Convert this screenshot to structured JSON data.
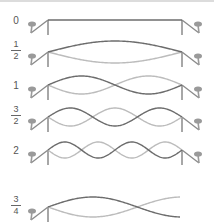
{
  "diagram": {
    "colors": {
      "dark_wave": "#6c6c6c",
      "light_wave": "#bcbcbc",
      "bridge": "#8a8a8a",
      "peg": "#9a9a9a",
      "label": "#555555",
      "border": "#dcdcdc"
    },
    "rows": [
      {
        "label": "0",
        "is_fraction": false,
        "num": "",
        "den": "",
        "cy": 20,
        "cycles": 0,
        "amp": 0,
        "right_bridge": true
      },
      {
        "label": "1/2",
        "is_fraction": true,
        "num": "1",
        "den": "2",
        "cy": 52,
        "cycles": 0.5,
        "amp": 11,
        "right_bridge": true
      },
      {
        "label": "1",
        "is_fraction": false,
        "num": "",
        "den": "",
        "cy": 85,
        "cycles": 1,
        "amp": 9,
        "right_bridge": true
      },
      {
        "label": "3/2",
        "is_fraction": true,
        "num": "3",
        "den": "2",
        "cy": 117,
        "cycles": 1.5,
        "amp": 9,
        "right_bridge": true
      },
      {
        "label": "2",
        "is_fraction": false,
        "num": "",
        "den": "",
        "cy": 150,
        "cycles": 2,
        "amp": 8,
        "right_bridge": true
      },
      {
        "label": "3/4",
        "is_fraction": true,
        "num": "3",
        "den": "4",
        "cy": 207,
        "cycles": 0.75,
        "amp": 10,
        "right_bridge": false
      }
    ]
  }
}
